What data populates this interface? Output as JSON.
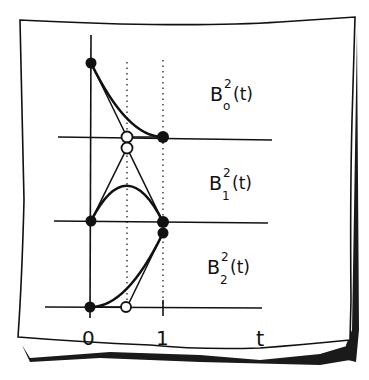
{
  "figure": {
    "colors": {
      "ink": "#111111",
      "paper": "#ffffff",
      "shadow": "#1a1a1a"
    }
  },
  "panels": [
    {
      "id": "b0",
      "label_base": "B",
      "label_sup": "2",
      "label_sub": "o",
      "label_arg": "(t)"
    },
    {
      "id": "b1",
      "label_base": "B",
      "label_sup": "2",
      "label_sub": "1",
      "label_arg": "(t)"
    },
    {
      "id": "b2",
      "label_base": "B",
      "label_sup": "2",
      "label_sub": "2",
      "label_arg": "(t)"
    }
  ],
  "axis": {
    "tick_labels": [
      "0",
      "1"
    ],
    "variable_label": "t"
  },
  "control_points": {
    "b0": [
      {
        "t": 0,
        "v": 1,
        "style": "filled"
      },
      {
        "t": 0.5,
        "v": 0,
        "style": "open"
      },
      {
        "t": 1,
        "v": 0,
        "style": "filled"
      }
    ],
    "b1": [
      {
        "t": 0,
        "v": 0,
        "style": "filled"
      },
      {
        "t": 0.5,
        "v": 1,
        "style": "open"
      },
      {
        "t": 1,
        "v": 0,
        "style": "filled"
      }
    ],
    "b2": [
      {
        "t": 0,
        "v": 0,
        "style": "filled"
      },
      {
        "t": 0.5,
        "v": 0,
        "style": "open"
      },
      {
        "t": 1,
        "v": 1,
        "style": "filled"
      }
    ]
  }
}
